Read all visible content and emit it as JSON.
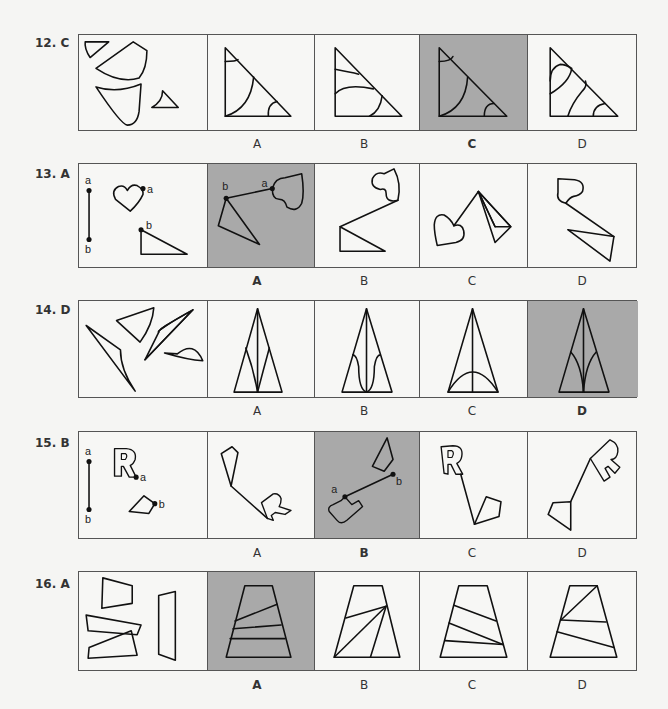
{
  "questions": [
    {
      "number": "12.",
      "answer": "C",
      "options": [
        "A",
        "B",
        "C",
        "D"
      ],
      "correct_index": 2
    },
    {
      "number": "13.",
      "answer": "A",
      "options": [
        "A",
        "B",
        "C",
        "D"
      ],
      "correct_index": 0
    },
    {
      "number": "14.",
      "answer": "D",
      "options": [
        "A",
        "B",
        "C",
        "D"
      ],
      "correct_index": 3
    },
    {
      "number": "15.",
      "answer": "B",
      "options": [
        "A",
        "B",
        "C",
        "D"
      ],
      "correct_index": 1
    },
    {
      "number": "16.",
      "answer": "A",
      "options": [
        "A",
        "B",
        "C",
        "D"
      ],
      "correct_index": 0
    }
  ],
  "point_labels": {
    "a": "a",
    "b": "b"
  },
  "colors": {
    "shaded": "#a9a9a9",
    "line": "#111111",
    "background": "#f5f5f3"
  }
}
